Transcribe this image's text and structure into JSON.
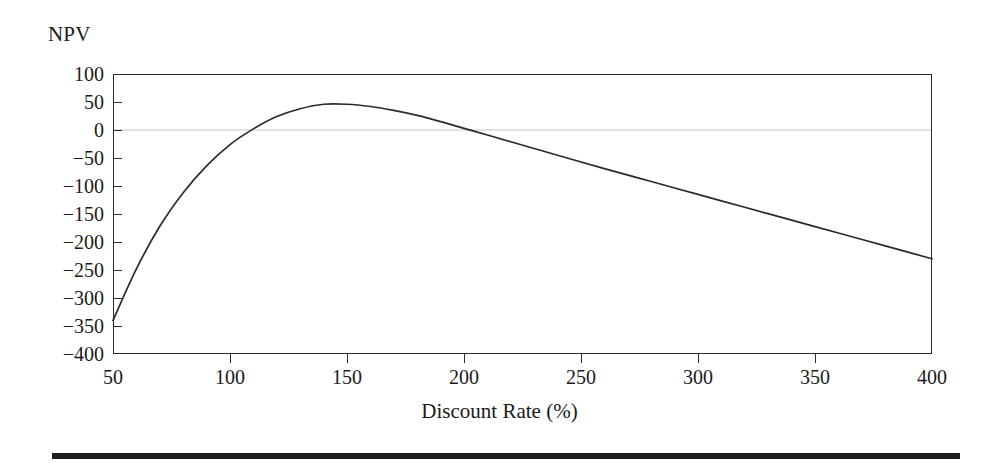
{
  "figure": {
    "y_axis_title": "NPV",
    "x_axis_title": "Discount Rate (%)"
  },
  "axes": {
    "y_ticks": [
      100,
      50,
      0,
      -50,
      -100,
      -150,
      -200,
      -250,
      -300,
      -350,
      -400
    ],
    "y_tick_labels": [
      "100",
      "50",
      "0",
      "−50",
      "−100",
      "−150",
      "−200",
      "−250",
      "−300",
      "−350",
      "−400"
    ],
    "x_ticks": [
      50,
      100,
      150,
      200,
      250,
      300,
      350,
      400
    ],
    "x_tick_labels": [
      "50",
      "100",
      "150",
      "200",
      "250",
      "300",
      "350",
      "400"
    ]
  },
  "colors": {
    "curve": "#2b2b2b",
    "frame": "#2b2b2b",
    "zero_line": "#d8d8d8",
    "rule": "#1c1c1c",
    "background": "#ffffff",
    "text": "#1a1a1a"
  },
  "chart_data": {
    "type": "line",
    "title": "",
    "subtitle": "",
    "xlabel": "Discount Rate (%)",
    "ylabel": "NPV",
    "xlim": [
      50,
      400
    ],
    "ylim": [
      -400,
      100
    ],
    "grid": false,
    "legend": null,
    "annotations": [],
    "zero_reference_line": 0,
    "series": [
      {
        "name": "NPV",
        "x": [
          50,
          60,
          70,
          80,
          90,
          100,
          110,
          120,
          130,
          140,
          150,
          160,
          170,
          180,
          190,
          200,
          210,
          220,
          240,
          260,
          280,
          300,
          320,
          340,
          360,
          380,
          400
        ],
        "values": [
          -340,
          -248,
          -172,
          -112,
          -64,
          -26,
          2,
          24,
          38,
          46,
          46,
          42,
          35,
          26,
          15,
          3,
          -9,
          -21,
          -45,
          -69,
          -92,
          -115,
          -138,
          -161,
          -184,
          -207,
          -230
        ]
      }
    ]
  }
}
